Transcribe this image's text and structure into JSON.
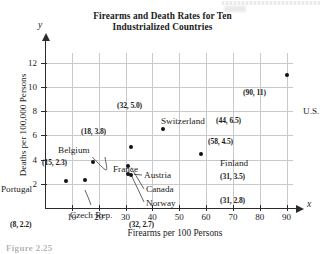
{
  "figure": {
    "title_line1": "Firearms and Death Rates for Ten",
    "title_line2": "Industrialized Countries",
    "caption": "Figure 2.25"
  },
  "chart_data": {
    "type": "scatter",
    "title": "Firearms and Death Rates for Ten Industrialized Countries",
    "xlabel": "Firearms per 100 Persons",
    "ylabel": "Deaths per 100,000 Persons",
    "axis_letter_x": "x",
    "axis_letter_y": "y",
    "xlim": [
      0,
      95
    ],
    "ylim": [
      0,
      12.8
    ],
    "xticks": [
      10,
      20,
      30,
      40,
      50,
      60,
      70,
      80,
      90
    ],
    "yticks": [
      2,
      4,
      6,
      8,
      10,
      12
    ],
    "xtick_labels": [
      "10",
      "20",
      "30",
      "40",
      "50",
      "60",
      "70",
      "80",
      "90"
    ],
    "ytick_labels": [
      "2",
      "4",
      "6",
      "8",
      "10",
      "12"
    ],
    "grid": true,
    "legend": "none",
    "points": [
      {
        "country": "Portugal",
        "x": 8,
        "y": 2.2,
        "coord_label": "(8, 2.2)"
      },
      {
        "country": "Czech Rep.",
        "x": 15,
        "y": 2.3,
        "coord_label": "(15, 2.3)"
      },
      {
        "country": "Belgium",
        "x": 18,
        "y": 3.8,
        "coord_label": "(18, 3.8)"
      },
      {
        "country": "Norway",
        "x": 31,
        "y": 2.8,
        "coord_label": "(31, 2.8)"
      },
      {
        "country": "Canada",
        "x": 31,
        "y": 3.5,
        "coord_label": "(31, 3.5)"
      },
      {
        "country": "Austria",
        "x": 32,
        "y": 2.7,
        "coord_label": "(32, 2.7)"
      },
      {
        "country": "France",
        "x": 32,
        "y": 5.0,
        "coord_label": "(32, 5.0)"
      },
      {
        "country": "Switzerland",
        "x": 44,
        "y": 6.5,
        "coord_label": "(44, 6.5)"
      },
      {
        "country": "Finland",
        "x": 58,
        "y": 4.5,
        "coord_label": "(58, 4.5)"
      },
      {
        "country": "U.S.",
        "x": 90,
        "y": 11.0,
        "coord_label": "(90, 11)"
      }
    ],
    "country_labels": [
      {
        "text": "Portugal",
        "left": -44,
        "top": 131
      },
      {
        "text": "Czech Rep.",
        "left": 25,
        "top": 157
      },
      {
        "text": "Belgium",
        "left": 13,
        "top": 92
      },
      {
        "text": "France",
        "left": 68,
        "top": 111
      },
      {
        "text": "Switzerland",
        "left": 116,
        "top": 63
      },
      {
        "text": "Austria",
        "left": 99,
        "top": 117
      },
      {
        "text": "Canada",
        "left": 101,
        "top": 131
      },
      {
        "text": "Norway",
        "left": 101,
        "top": 145
      },
      {
        "text": "Finland",
        "left": 175,
        "top": 105
      },
      {
        "text": "U.S.",
        "left": 258,
        "top": 53
      }
    ],
    "coord_labels": [
      {
        "text": "(8, 2.2)",
        "left": -35,
        "top": 167
      },
      {
        "text": "(15, 2.3)",
        "left": -3,
        "top": 105
      },
      {
        "text": "(18, 3.8)",
        "left": 36,
        "top": 74
      },
      {
        "text": "(32, 5.0)",
        "left": 72,
        "top": 48
      },
      {
        "text": "(32, 2.7)",
        "left": 84,
        "top": 167
      },
      {
        "text": "(31, 3.5)",
        "left": 175,
        "top": 119
      },
      {
        "text": "(31, 2.8)",
        "left": 175,
        "top": 143
      },
      {
        "text": "(44, 6.5)",
        "left": 171,
        "top": 63
      },
      {
        "text": "(58, 4.5)",
        "left": 163,
        "top": 84
      },
      {
        "text": "(90, 11)",
        "left": 198,
        "top": 35
      }
    ]
  }
}
